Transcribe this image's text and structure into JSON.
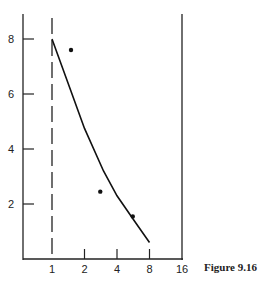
{
  "chart_data": {
    "type": "scatter",
    "title": "",
    "caption": "Figure 9.16",
    "xlabel": "",
    "ylabel": "",
    "x_scale": "log2",
    "x_ticks": [
      1,
      2,
      4,
      8,
      16
    ],
    "x_tick_labels": [
      "1",
      "2",
      "4",
      "8",
      "16"
    ],
    "y_ticks": [
      2,
      4,
      6,
      8
    ],
    "y_tick_labels": [
      "2",
      "4",
      "6",
      "8"
    ],
    "ylim": [
      0,
      8.9
    ],
    "grid": false,
    "legend": null,
    "annotations": [
      "dashed vertical line at x = 1"
    ],
    "series": [
      {
        "name": "points",
        "kind": "scatter",
        "x": [
          1.5,
          2.8,
          5.6
        ],
        "y": [
          7.6,
          2.45,
          1.55
        ]
      },
      {
        "name": "fitted curve",
        "kind": "line",
        "x": [
          1,
          1.5,
          2,
          3,
          4,
          6,
          8
        ],
        "y": [
          8.0,
          6.1,
          4.75,
          3.2,
          2.3,
          1.3,
          0.6
        ]
      }
    ]
  },
  "figure": {
    "caption": "Figure 9.16"
  }
}
